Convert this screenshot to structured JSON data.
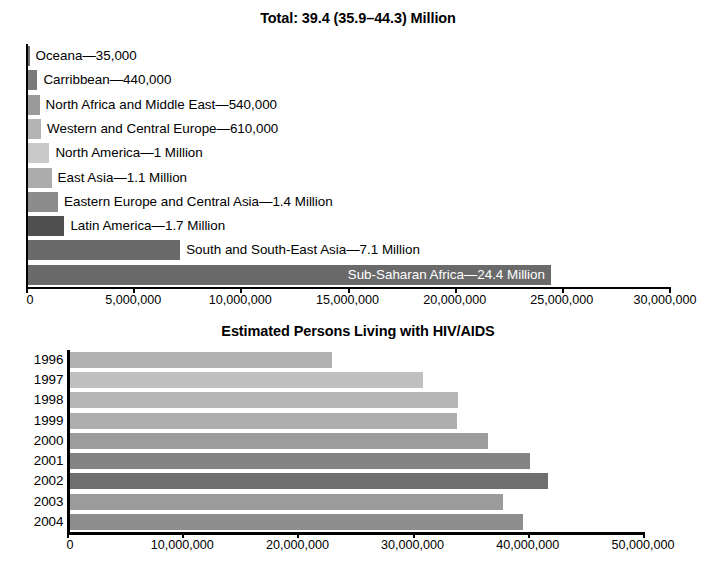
{
  "chart_data": [
    {
      "type": "bar",
      "orientation": "horizontal",
      "title": "Total: 39.4 (35.9–44.3) Million",
      "xlabel": "",
      "ylabel": "",
      "xlim": [
        0,
        30000000
      ],
      "xticks": [
        0,
        5000000,
        10000000,
        15000000,
        20000000,
        25000000,
        30000000
      ],
      "xticklabels": [
        "0",
        "5,000,000",
        "10,000,000",
        "15,000,000",
        "20,000,000",
        "25,000,000",
        "30,000,000"
      ],
      "grid": false,
      "legend": "none",
      "categories": [
        "Oceana",
        "Carribbean",
        "North Africa and Middle East",
        "Western and Central Europe",
        "North America",
        "East Asia",
        "Eastern Europe and Central Asia",
        "Latin America",
        "South and South-East Asia",
        "Sub-Saharan Africa"
      ],
      "values": [
        35000,
        440000,
        540000,
        610000,
        1000000,
        1100000,
        1400000,
        1700000,
        7100000,
        24400000
      ],
      "data_labels": [
        "Oceana—35,000",
        "Carribbean—440,000",
        "North Africa and Middle East—540,000",
        "Western and Central Europe—610,000",
        "North America—1 Million",
        "East Asia—1.1 Million",
        "Eastern Europe and Central Asia—1.4 Million",
        "Latin America—1.7 Million",
        "South and South-East Asia—7.1 Million",
        "Sub-Saharan Africa—24.4 Million"
      ],
      "label_placement": [
        "outside",
        "outside",
        "outside",
        "outside",
        "outside",
        "outside",
        "outside",
        "outside",
        "outside",
        "inside"
      ],
      "bar_colors": [
        "#6e6e6e",
        "#7a7a7a",
        "#9a9a9a",
        "#b4b4b4",
        "#c9c9c9",
        "#acacac",
        "#8c8c8c",
        "#4f4f4f",
        "#6a6a6a",
        "#6a6a6a"
      ]
    },
    {
      "type": "bar",
      "orientation": "horizontal",
      "title": "Estimated Persons Living with HIV/AIDS",
      "xlabel": "",
      "ylabel": "",
      "xlim": [
        0,
        50000000
      ],
      "xticks": [
        0,
        10000000,
        20000000,
        30000000,
        40000000,
        50000000
      ],
      "xticklabels": [
        "0",
        "10,000,000",
        "20,000,000",
        "30,000,000",
        "40,000,000",
        "50,000,000"
      ],
      "grid": false,
      "legend": "none",
      "categories": [
        "1996",
        "1997",
        "1998",
        "1999",
        "2000",
        "2001",
        "2002",
        "2003",
        "2004"
      ],
      "values": [
        22800000,
        30700000,
        33700000,
        33600000,
        36300000,
        40000000,
        41500000,
        37600000,
        39400000
      ],
      "bar_colors": [
        "#b2b2b2",
        "#c0c0c0",
        "#b6b6b6",
        "#aeaeae",
        "#9d9d9d",
        "#848484",
        "#6f6f6f",
        "#9b9b9b",
        "#8d8d8d"
      ]
    }
  ],
  "colors": {
    "axis": "#000000",
    "background": "#ffffff",
    "text": "#000000",
    "inside_label": "#ffffff"
  }
}
